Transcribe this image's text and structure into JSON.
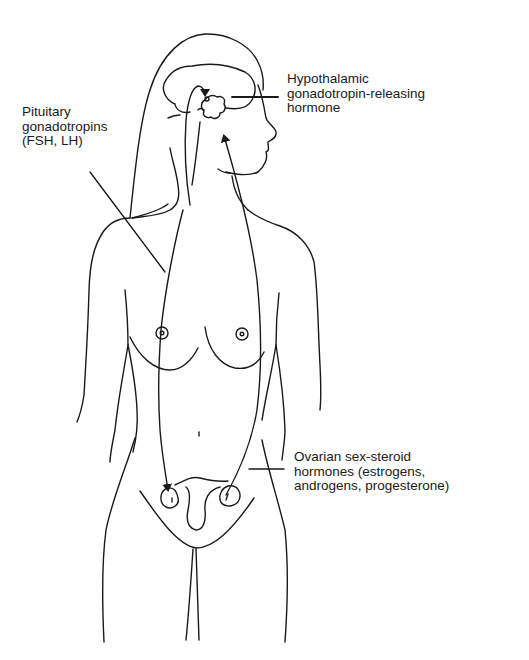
{
  "figure": {
    "stroke_color": "#1a1a1a",
    "background_color": "#ffffff"
  },
  "labels": {
    "hypothalamic": {
      "lines": [
        "Hypothalamic",
        "gonadotropin-releasing",
        "hormone"
      ]
    },
    "pituitary": {
      "lines": [
        "Pituitary",
        "gonadotropins",
        "(FSH, LH)"
      ]
    },
    "ovarian": {
      "lines": [
        "Ovarian sex-steroid",
        "hormones (estrogens,",
        "androgens, progesterone)"
      ]
    }
  },
  "arrows": [
    {
      "name": "pituitary-to-ovary-arrow",
      "from": "pituitary",
      "to": "left ovary",
      "direction": "down"
    },
    {
      "name": "ovary-to-hypothalamus-arrow",
      "from": "right ovary",
      "to": "hypothalamus",
      "direction": "up"
    },
    {
      "name": "brain-loop-arrow",
      "from": "pituitary stalk",
      "to": "hypothalamus",
      "direction": "up"
    }
  ]
}
